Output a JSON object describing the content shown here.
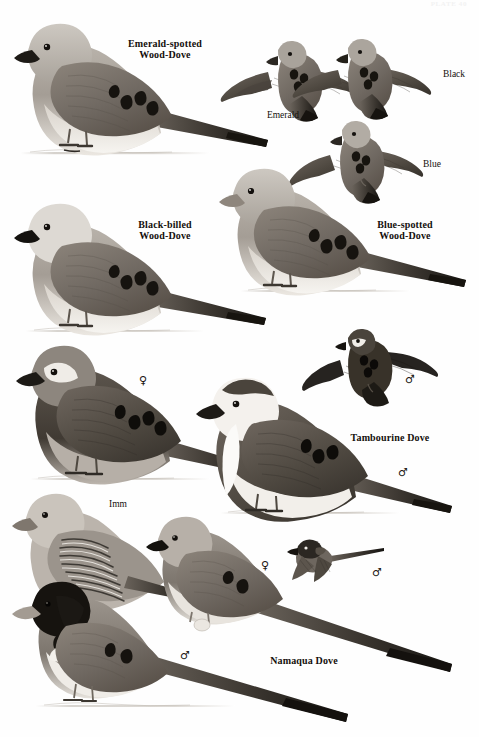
{
  "plate": {
    "number_text": "PLATE 40",
    "width": 479,
    "height": 737,
    "background_color": "#fefefe",
    "ink_color": "#14100c"
  },
  "labels": {
    "species": [
      {
        "id": "emerald-spotted-wood-dove",
        "text": "Emerald-spotted\nWood-Dove",
        "x": 112,
        "y": 38,
        "width": 106
      },
      {
        "id": "black-billed-wood-dove",
        "text": "Black-billed\nWood-Dove",
        "x": 112,
        "y": 219,
        "width": 106
      },
      {
        "id": "blue-spotted-wood-dove",
        "text": "Blue-spotted\nWood-Dove",
        "x": 352,
        "y": 219,
        "width": 106
      },
      {
        "id": "tambourine-dove",
        "text": "Tambourine Dove",
        "x": 340,
        "y": 432,
        "width": 100
      },
      {
        "id": "namaqua-dove",
        "text": "Namaqua Dove",
        "x": 258,
        "y": 655,
        "width": 92
      }
    ],
    "morphs": [
      {
        "id": "emerald-morph",
        "text": "Emerald",
        "x": 259,
        "y": 110,
        "width": 48
      },
      {
        "id": "black-morph",
        "text": "Black",
        "x": 434,
        "y": 69,
        "width": 40
      },
      {
        "id": "blue-morph",
        "text": "Blue",
        "x": 414,
        "y": 159,
        "width": 36
      }
    ],
    "ages": [
      {
        "id": "immature",
        "text": "Imm",
        "x": 104,
        "y": 499,
        "width": 28
      }
    ],
    "sex_symbols": [
      {
        "id": "tambourine-female-perched",
        "glyph": "♀",
        "x": 139,
        "y": 375
      },
      {
        "id": "tambourine-male-flight",
        "glyph": "♂",
        "x": 405,
        "y": 374
      },
      {
        "id": "tambourine-male-perched",
        "glyph": "♂",
        "x": 398,
        "y": 467
      },
      {
        "id": "namaqua-female-perched",
        "glyph": "♀",
        "x": 261,
        "y": 560
      },
      {
        "id": "namaqua-male-flight",
        "glyph": "♂",
        "x": 372,
        "y": 567
      },
      {
        "id": "namaqua-male-perched",
        "glyph": "♂",
        "x": 180,
        "y": 650
      }
    ]
  },
  "illustrations": {
    "emerald_spotted_perched": {
      "name": "emerald-spotted-wood-dove-perched-illustration"
    },
    "emerald_flight": {
      "name": "emerald-spotted-wood-dove-flight-illustration"
    },
    "black_flight": {
      "name": "black-billed-wood-dove-flight-illustration"
    },
    "blue_flight": {
      "name": "blue-spotted-wood-dove-flight-illustration"
    },
    "black_billed_perched": {
      "name": "black-billed-wood-dove-perched-illustration"
    },
    "blue_spotted_perched": {
      "name": "blue-spotted-wood-dove-perched-illustration"
    },
    "tambourine_female_perched": {
      "name": "tambourine-dove-female-perched-illustration"
    },
    "tambourine_male_perched": {
      "name": "tambourine-dove-male-perched-illustration"
    },
    "tambourine_male_flight": {
      "name": "tambourine-dove-male-flight-illustration"
    },
    "namaqua_immature": {
      "name": "namaqua-dove-immature-illustration"
    },
    "namaqua_female_perched": {
      "name": "namaqua-dove-female-perched-illustration"
    },
    "namaqua_male_perched": {
      "name": "namaqua-dove-male-perched-illustration"
    },
    "namaqua_male_flight": {
      "name": "namaqua-dove-male-flight-illustration"
    }
  }
}
